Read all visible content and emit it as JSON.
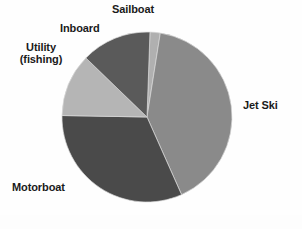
{
  "chart_data": {
    "type": "pie",
    "title": "",
    "subtitle": "",
    "xlabel": "",
    "ylabel": "",
    "grid": false,
    "legend_position": "outside-labels",
    "center": {
      "x": 147,
      "y": 117
    },
    "radius": 85,
    "start_angle_deg": -88,
    "direction": "clockwise",
    "categories": [
      "Sailboat",
      "Jet Ski",
      "Motorboat",
      "Utility (fishing)",
      "Inboard"
    ],
    "values": [
      2,
      41,
      32,
      12,
      13
    ],
    "slices": [
      {
        "label": "Sailboat",
        "value": 2,
        "color": "#b0b0b0",
        "start_angle_deg": -88,
        "end_angle_deg": -81
      },
      {
        "label": "Jet Ski",
        "value": 41,
        "color": "#8a8a8a",
        "start_angle_deg": -81,
        "end_angle_deg": 66
      },
      {
        "label": "Motorboat",
        "value": 32,
        "color": "#4a4a4a",
        "start_angle_deg": 66,
        "end_angle_deg": 181
      },
      {
        "label": "Utility (fishing)",
        "value": 12,
        "color": "#b5b5b5",
        "start_angle_deg": 181,
        "end_angle_deg": 224
      },
      {
        "label": "Inboard",
        "value": 13,
        "color": "#5a5a5a",
        "start_angle_deg": 224,
        "end_angle_deg": 272
      }
    ]
  },
  "labels": {
    "sailboat": "Sailboat",
    "inboard": "Inboard",
    "utility_line1": "Utility",
    "utility_line2": "(fishing)",
    "jet_ski": "Jet Ski",
    "motorboat": "Motorboat"
  },
  "colors": {
    "jet_ski": "#8a8a8a",
    "motorboat": "#4a4a4a",
    "utility": "#b5b5b5",
    "inboard": "#5a5a5a",
    "sailboat": "#b0b0b0",
    "background": "#fefefe",
    "label_text": "#1a1a1a"
  }
}
